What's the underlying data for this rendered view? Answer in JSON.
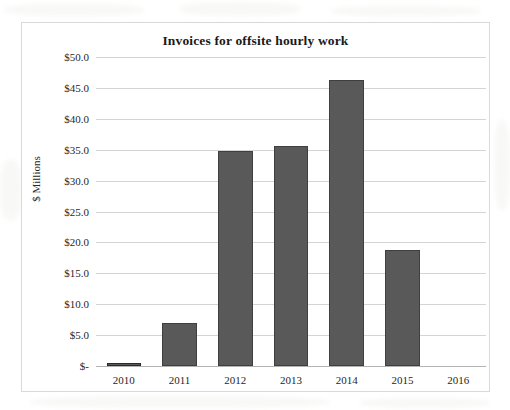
{
  "chart_data": {
    "type": "bar",
    "title": "Invoices for offsite hourly work",
    "xlabel": "",
    "ylabel": "$ Millions",
    "categories": [
      "2010",
      "2011",
      "2012",
      "2013",
      "2014",
      "2015",
      "2016"
    ],
    "values": [
      0.3,
      7.0,
      34.8,
      35.6,
      46.2,
      18.7,
      0
    ],
    "ylim": [
      0,
      50
    ],
    "ytick_values": [
      0,
      5,
      10,
      15,
      20,
      25,
      30,
      35,
      40,
      45,
      50
    ],
    "ytick_labels": [
      "$-",
      "$5.0",
      "$10.0",
      "$15.0",
      "$20.0",
      "$25.0",
      "$30.0",
      "$35.0",
      "$40.0",
      "$45.0",
      "$50.0"
    ],
    "grid": true,
    "legend": false,
    "series_color": "#595959",
    "gridline_color": "#d4d4d4",
    "frame_color": "#d9d9d9"
  }
}
